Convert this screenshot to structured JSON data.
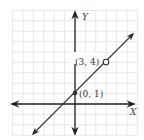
{
  "graph": {
    "x_axis_label": "X",
    "y_axis_label": "Y",
    "grid": {
      "x_min": -6,
      "x_max": 6,
      "y_min": -3,
      "y_max": 9,
      "color": "#dddddd"
    },
    "line": {
      "slope": 1,
      "intercept": 1,
      "color": "#333333"
    },
    "points": [
      {
        "x": 0,
        "y": 1,
        "label": "(0, 1)",
        "style": "closed"
      },
      {
        "x": 3,
        "y": 4,
        "label": "(3, 4)",
        "style": "open"
      }
    ]
  },
  "chart_data": {
    "type": "line",
    "title": "",
    "xlabel": "X",
    "ylabel": "Y",
    "series": [
      {
        "name": "y = x + 1",
        "x": [
          -3,
          0,
          3,
          5
        ],
        "y": [
          -2,
          1,
          4,
          6
        ]
      }
    ],
    "points": [
      {
        "x": 0,
        "y": 1,
        "label": "(0, 1)",
        "marker": "filled"
      },
      {
        "x": 3,
        "y": 4,
        "label": "(3, 4)",
        "marker": "open"
      }
    ],
    "grid": true
  }
}
